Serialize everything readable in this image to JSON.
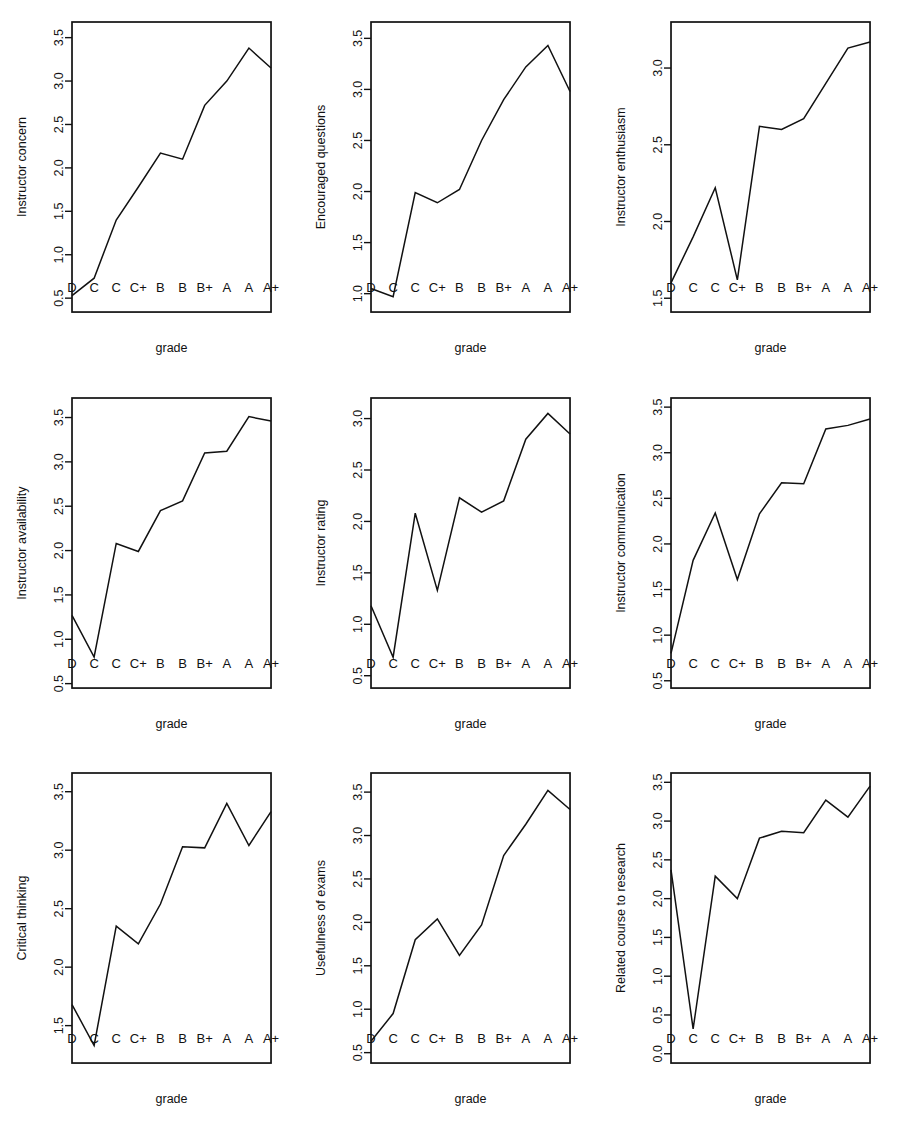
{
  "figure": {
    "type": "multi-panel-line-chart",
    "panel_rows": 3,
    "panel_cols": 3,
    "background_color": "#ffffff",
    "line_color": "#111111"
  },
  "chart_data": [
    {
      "type": "line",
      "title": "",
      "xlabel": "grade",
      "ylabel": "Instructor concern",
      "categories": [
        "D",
        "C",
        "C",
        "C+",
        "B",
        "B",
        "B+",
        "A",
        "A",
        "A+"
      ],
      "values": [
        0.53,
        0.73,
        1.4,
        1.78,
        2.17,
        2.1,
        2.72,
        3.0,
        3.38,
        3.15
      ],
      "yticks": [
        0.5,
        1.0,
        1.5,
        2.0,
        2.5,
        3.0,
        3.5
      ],
      "yticklabels": [
        "0.5",
        "1.0",
        "1.5",
        "2.0",
        "2.5",
        "3.0",
        "3.5"
      ],
      "ylim": [
        0.34,
        3.68
      ],
      "grid": false,
      "legend": "none"
    },
    {
      "type": "line",
      "title": "",
      "xlabel": "grade",
      "ylabel": "Encouraged questions",
      "categories": [
        "D",
        "C",
        "C",
        "C+",
        "B",
        "B",
        "B+",
        "A",
        "A",
        "A+"
      ],
      "values": [
        1.05,
        0.97,
        1.99,
        1.89,
        2.02,
        2.5,
        2.9,
        3.22,
        3.43,
        2.98
      ],
      "yticks": [
        1.0,
        1.5,
        2.0,
        2.5,
        3.0,
        3.5
      ],
      "yticklabels": [
        "1.0",
        "1.5",
        "2.0",
        "2.5",
        "3.0",
        "3.5"
      ],
      "ylim": [
        0.82,
        3.66
      ],
      "grid": false,
      "legend": "none"
    },
    {
      "type": "line",
      "title": "",
      "xlabel": "grade",
      "ylabel": "Instructor enthusiasm",
      "categories": [
        "D",
        "C",
        "C",
        "C+",
        "B",
        "B",
        "B+",
        "A",
        "A",
        "A+"
      ],
      "values": [
        1.6,
        1.9,
        2.22,
        1.62,
        2.62,
        2.6,
        2.67,
        2.9,
        3.13,
        3.17
      ],
      "yticks": [
        1.5,
        2.0,
        2.5,
        3.0
      ],
      "yticklabels": [
        "1.5",
        "2.0",
        "2.5",
        "3.0"
      ],
      "ylim": [
        1.41,
        3.3
      ],
      "grid": false,
      "legend": "none"
    },
    {
      "type": "line",
      "title": "",
      "xlabel": "grade",
      "ylabel": "Instructor availability",
      "categories": [
        "D",
        "C",
        "C",
        "C+",
        "B",
        "B",
        "B+",
        "A",
        "A",
        "A+"
      ],
      "values": [
        1.27,
        0.8,
        2.08,
        1.99,
        2.45,
        2.56,
        3.1,
        3.12,
        3.51,
        3.46
      ],
      "yticks": [
        0.5,
        1.0,
        1.5,
        2.0,
        2.5,
        3.0,
        3.5
      ],
      "yticklabels": [
        "0.5",
        "1.0",
        "1.5",
        "2.0",
        "2.5",
        "3.0",
        "3.5"
      ],
      "ylim": [
        0.45,
        3.72
      ],
      "grid": false,
      "legend": "none"
    },
    {
      "type": "line",
      "title": "",
      "xlabel": "grade",
      "ylabel": "Instructor rating",
      "categories": [
        "D",
        "C",
        "C",
        "C+",
        "B",
        "B",
        "B+",
        "A",
        "A",
        "A+"
      ],
      "values": [
        1.18,
        0.68,
        2.08,
        1.33,
        2.23,
        2.09,
        2.2,
        2.8,
        3.05,
        2.85
      ],
      "yticks": [
        0.5,
        1.0,
        1.5,
        2.0,
        2.5,
        3.0
      ],
      "yticklabels": [
        "0.5",
        "1.0",
        "1.5",
        "2.0",
        "2.5",
        "3.0"
      ],
      "ylim": [
        0.38,
        3.2
      ],
      "grid": false,
      "legend": "none"
    },
    {
      "type": "line",
      "title": "",
      "xlabel": "grade",
      "ylabel": "Instructor communication",
      "categories": [
        "D",
        "C",
        "C",
        "C+",
        "B",
        "B",
        "B+",
        "A",
        "A",
        "A+"
      ],
      "values": [
        0.8,
        1.82,
        2.34,
        1.61,
        2.33,
        2.67,
        2.66,
        3.26,
        3.3,
        3.37
      ],
      "yticks": [
        0.5,
        1.0,
        1.5,
        2.0,
        2.5,
        3.0,
        3.5
      ],
      "yticklabels": [
        "0.5",
        "1.0",
        "1.5",
        "2.0",
        "2.5",
        "3.0",
        "3.5"
      ],
      "ylim": [
        0.42,
        3.6
      ],
      "grid": false,
      "legend": "none"
    },
    {
      "type": "line",
      "title": "",
      "xlabel": "grade",
      "ylabel": "Critical thinking",
      "categories": [
        "D",
        "C",
        "C",
        "C+",
        "B",
        "B",
        "B+",
        "A",
        "A",
        "A+"
      ],
      "values": [
        1.68,
        1.33,
        2.35,
        2.2,
        2.54,
        3.03,
        3.02,
        3.4,
        3.04,
        3.33
      ],
      "yticks": [
        1.5,
        2.0,
        2.5,
        3.0,
        3.5
      ],
      "yticklabels": [
        "1.5",
        "2.0",
        "2.5",
        "3.0",
        "3.5"
      ],
      "ylim": [
        1.18,
        3.66
      ],
      "grid": false,
      "legend": "none"
    },
    {
      "type": "line",
      "title": "",
      "xlabel": "grade",
      "ylabel": "Usefulness of exams",
      "categories": [
        "D",
        "C",
        "C",
        "C+",
        "B",
        "B",
        "B+",
        "A",
        "A",
        "A+"
      ],
      "values": [
        0.63,
        0.95,
        1.8,
        2.04,
        1.62,
        1.97,
        2.77,
        3.13,
        3.52,
        3.3
      ],
      "yticks": [
        0.5,
        1.0,
        1.5,
        2.0,
        2.5,
        3.0,
        3.5
      ],
      "yticklabels": [
        "0.5",
        "1.0",
        "1.5",
        "2.0",
        "2.5",
        "3.0",
        "3.5"
      ],
      "ylim": [
        0.38,
        3.72
      ],
      "grid": false,
      "legend": "none"
    },
    {
      "type": "line",
      "title": "",
      "xlabel": "grade",
      "ylabel": "Related course to research",
      "categories": [
        "D",
        "C",
        "C",
        "C+",
        "B",
        "B",
        "B+",
        "A",
        "A",
        "A+"
      ],
      "values": [
        2.37,
        0.32,
        2.29,
        2.0,
        2.78,
        2.87,
        2.85,
        3.27,
        3.05,
        3.45
      ],
      "yticks": [
        0.0,
        0.5,
        1.0,
        1.5,
        2.0,
        2.5,
        3.0,
        3.5
      ],
      "yticklabels": [
        "0.0",
        "0.5",
        "1.0",
        "1.5",
        "2.0",
        "2.5",
        "3.0",
        "3.5"
      ],
      "ylim": [
        -0.12,
        3.62
      ],
      "grid": false,
      "legend": "none"
    }
  ]
}
